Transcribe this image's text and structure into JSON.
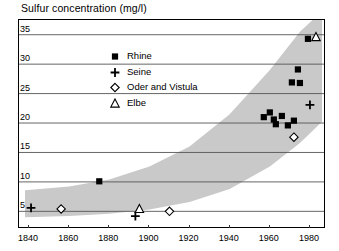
{
  "chart_data": {
    "type": "scatter",
    "title": "Sulfur concentration (mg/l)",
    "xlabel": "",
    "ylabel": "",
    "xlim": [
      1835,
      1988
    ],
    "ylim": [
      2.0,
      37.5
    ],
    "xticks": [
      1840,
      1860,
      1880,
      1900,
      1920,
      1940,
      1960,
      1980
    ],
    "yticks": [
      5,
      10,
      15,
      20,
      25,
      30,
      35
    ],
    "grid": "horizontal",
    "legend_position": "upper-left-inside",
    "series": [
      {
        "name": "Rhine",
        "marker": "filled-square",
        "color": "#000000",
        "points": [
          [
            1875,
            10.1
          ],
          [
            1957,
            21.0
          ],
          [
            1960,
            21.8
          ],
          [
            1962,
            20.6
          ],
          [
            1963,
            19.8
          ],
          [
            1966,
            21.2
          ],
          [
            1969,
            19.6
          ],
          [
            1972,
            20.4
          ],
          [
            1971,
            26.9
          ],
          [
            1975,
            26.8
          ],
          [
            1974,
            29.1
          ],
          [
            1979,
            34.3
          ]
        ]
      },
      {
        "name": "Seine",
        "marker": "plus",
        "color": "#000000",
        "points": [
          [
            1841,
            5.6
          ],
          [
            1893,
            4.2
          ],
          [
            1980,
            23.1
          ]
        ]
      },
      {
        "name": "Oder and Vistula",
        "marker": "open-diamond",
        "color": "#000000",
        "points": [
          [
            1856,
            5.4
          ],
          [
            1910,
            5.0
          ],
          [
            1972,
            17.6
          ]
        ]
      },
      {
        "name": "Elbe",
        "marker": "open-triangle",
        "color": "#000000",
        "points": [
          [
            1895,
            5.4
          ],
          [
            1983,
            34.6
          ]
        ]
      }
    ],
    "band": {
      "name": "uncertainty-envelope",
      "color": "#c9c9c9",
      "upper": [
        [
          1838,
          8.6
        ],
        [
          1860,
          9.2
        ],
        [
          1880,
          10.4
        ],
        [
          1900,
          12.6
        ],
        [
          1920,
          16.0
        ],
        [
          1940,
          21.5
        ],
        [
          1960,
          29.0
        ],
        [
          1975,
          35.5
        ],
        [
          1986,
          39.0
        ]
      ],
      "lower": [
        [
          1838,
          4.0
        ],
        [
          1860,
          4.2
        ],
        [
          1880,
          4.6
        ],
        [
          1900,
          5.3
        ],
        [
          1920,
          6.6
        ],
        [
          1940,
          8.8
        ],
        [
          1960,
          12.6
        ],
        [
          1975,
          16.6
        ],
        [
          1986,
          20.2
        ]
      ]
    },
    "legend_entries": [
      {
        "label": "Rhine",
        "marker": "filled-square"
      },
      {
        "label": "Seine",
        "marker": "plus"
      },
      {
        "label": "Oder and Vistula",
        "marker": "open-diamond"
      },
      {
        "label": "Elbe",
        "marker": "open-triangle"
      }
    ]
  },
  "axes": {
    "y_tick_labels": [
      "35",
      "30",
      "25",
      "20",
      "15",
      "10",
      "5"
    ],
    "x_tick_labels": [
      "1840",
      "1860",
      "1880",
      "1900",
      "1920",
      "1940",
      "1960",
      "1980"
    ]
  }
}
